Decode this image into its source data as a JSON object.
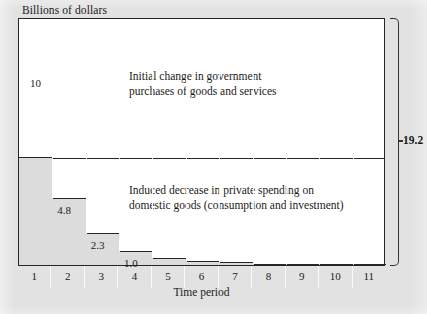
{
  "figure": {
    "y_axis_caption": "Billions of dollars",
    "x_axis_label": "Time period",
    "total_label": "19.2"
  },
  "blocks": {
    "initial": {
      "value_label": "10",
      "line1": "Initial change in government",
      "line2": "purchases of goods and services"
    },
    "induced": {
      "line1": "Induced decrease in private spending on",
      "line2": "domestic goods (consumption and investment)"
    }
  },
  "step_labels": [
    {
      "id": "step-2",
      "text": "4.8"
    },
    {
      "id": "step-3",
      "text": "2.3"
    },
    {
      "id": "step-4",
      "text": "1.0"
    }
  ],
  "chart_data": {
    "type": "bar",
    "title": "Billions of dollars",
    "xlabel": "Time period",
    "ylabel": "Billions of dollars",
    "categories": [
      "1",
      "2",
      "3",
      "4",
      "5",
      "6",
      "7",
      "8",
      "9",
      "10",
      "11"
    ],
    "series": [
      {
        "name": "Initial change in government purchases of goods and services",
        "values": [
          10,
          0,
          0,
          0,
          0,
          0,
          0,
          0,
          0,
          0,
          0
        ]
      },
      {
        "name": "Induced decrease in private spending on domestic goods (consumption and investment)",
        "values": [
          0,
          4.8,
          2.3,
          1.0,
          0.5,
          0.3,
          0.2,
          0.1,
          0.1,
          0.05,
          0.02
        ]
      }
    ],
    "cumulative_total": 19.2,
    "labeled_values": [
      "10",
      "4.8",
      "2.3",
      "1.0",
      "19.2"
    ],
    "ylim": [
      0,
      19.2
    ],
    "grid": false,
    "legend": "none"
  }
}
